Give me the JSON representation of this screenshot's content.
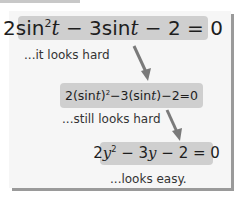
{
  "steps": [
    {
      "equation": {
        "coef1": "2",
        "fn1": "sin",
        "exp1": "2",
        "var1": "t",
        "op1": " − ",
        "coef2": "3",
        "fn2": "sin",
        "var2": "t",
        "op2": " − ",
        "const": "2",
        "eq": " = ",
        "rhs": "0"
      },
      "caption": "...it looks hard"
    },
    {
      "equation": {
        "pre": "2(sin",
        "var1": "t",
        "post1": ")",
        "exp1": "2",
        "mid": "−3(sin",
        "var2": "t",
        "post2": ")−2=0"
      },
      "caption": "...still looks hard"
    },
    {
      "equation": {
        "coef1": "2",
        "var1": "y",
        "exp1": "2",
        "op1": " − 3",
        "var2": "y",
        "rest": " − 2 = 0"
      },
      "caption": "...looks easy."
    }
  ],
  "colors": {
    "box": "#cfcfcf",
    "arrow": "#7a7a7a",
    "card": "#f6f6f6",
    "shadow": "#9a9a9a"
  }
}
